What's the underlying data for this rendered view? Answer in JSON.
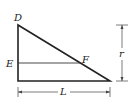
{
  "diagram": {
    "labels": {
      "D": "D",
      "E": "E",
      "F": "F",
      "r": "r",
      "L": "L"
    },
    "dimensions": {
      "height_label": "r",
      "width_label": "L"
    },
    "colors": {
      "stroke": "#222222",
      "background": "#ffffff"
    }
  }
}
